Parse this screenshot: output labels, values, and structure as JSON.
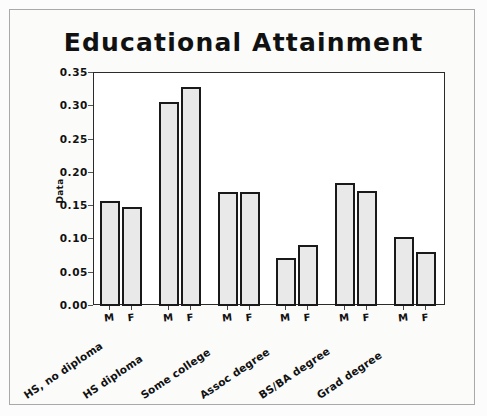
{
  "chart_data": {
    "type": "bar",
    "title": "Educational Attainment",
    "xlabel": "",
    "ylabel": "Data",
    "ylim": [
      0.0,
      0.35
    ],
    "yticks": [
      "0.00",
      "0.05",
      "0.10",
      "0.15",
      "0.20",
      "0.25",
      "0.30",
      "0.35"
    ],
    "ytick_values": [
      0.0,
      0.05,
      0.1,
      0.15,
      0.2,
      0.25,
      0.3,
      0.35
    ],
    "grid": false,
    "legend": "none",
    "categories": [
      "HS, no diploma",
      "HS diploma",
      "Some college",
      "Assoc degree",
      "BS/BA degree",
      "Grad degree"
    ],
    "group_tick_labels": [
      "M",
      "F"
    ],
    "series": [
      {
        "name": "M",
        "values": [
          0.158,
          0.307,
          0.171,
          0.072,
          0.185,
          0.103
        ]
      },
      {
        "name": "F",
        "values": [
          0.149,
          0.329,
          0.171,
          0.091,
          0.173,
          0.081
        ]
      }
    ],
    "colors": {
      "bar_fill": "#e9e9e9",
      "bar_edge": "#1a1a1a",
      "axis": "#2b2b2b",
      "text": "#111111",
      "page_background": "#fbfbfa",
      "plot_background": "#ffffff",
      "outer_border": "#a9a9a9"
    }
  }
}
